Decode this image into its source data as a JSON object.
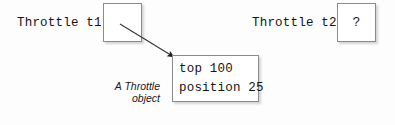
{
  "diagram": {
    "background_color": "#fdfdfd",
    "line_color": "#8b8b8b",
    "text_color": "#141414"
  },
  "references": [
    {
      "id": "t1",
      "label": "Throttle t1",
      "box_glyph": "",
      "points_to_object": true
    },
    {
      "id": "t2",
      "label": "Throttle t2",
      "box_glyph": "?",
      "points_to_object": false
    }
  ],
  "object_box": {
    "fields": [
      {
        "name": "top",
        "value": "100",
        "text": "top 100"
      },
      {
        "name": "position",
        "value": "25",
        "text": "position 25"
      }
    ]
  },
  "caption": {
    "line1": "A Throttle",
    "line2": "object"
  },
  "arrow": {
    "name": "reference-arrow",
    "from": "t1-box",
    "to": "object-box"
  }
}
